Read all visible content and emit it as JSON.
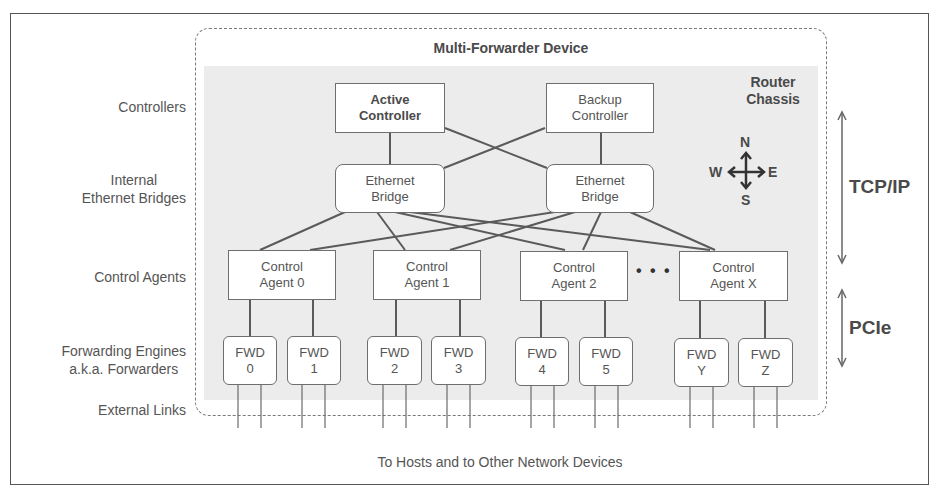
{
  "device_title": "Multi-Forwarder Device",
  "chassis_label": [
    "Router",
    "Chassis"
  ],
  "row_labels": {
    "controllers": "Controllers",
    "bridges": [
      "Internal",
      "Ethernet Bridges"
    ],
    "agents": "Control Agents",
    "forwarders": [
      "Forwarding Engines",
      "a.k.a. Forwarders"
    ],
    "links": "External Links"
  },
  "controllers": [
    {
      "line1": "Active",
      "line2": "Controller",
      "emphasis": true
    },
    {
      "line1": "Backup",
      "line2": "Controller",
      "emphasis": false
    }
  ],
  "bridges": [
    {
      "line1": "Ethernet",
      "line2": "Bridge"
    },
    {
      "line1": "Ethernet",
      "line2": "Bridge"
    }
  ],
  "agents": [
    {
      "line1": "Control",
      "line2": "Agent 0"
    },
    {
      "line1": "Control",
      "line2": "Agent 1"
    },
    {
      "line1": "Control",
      "line2": "Agent 2"
    },
    {
      "line1": "Control",
      "line2": "Agent X"
    }
  ],
  "ellipsis": "• • •",
  "forwarders": [
    {
      "line1": "FWD",
      "line2": "0"
    },
    {
      "line1": "FWD",
      "line2": "1"
    },
    {
      "line1": "FWD",
      "line2": "2"
    },
    {
      "line1": "FWD",
      "line2": "3"
    },
    {
      "line1": "FWD",
      "line2": "4"
    },
    {
      "line1": "FWD",
      "line2": "5"
    },
    {
      "line1": "FWD",
      "line2": "Y"
    },
    {
      "line1": "FWD",
      "line2": "Z"
    }
  ],
  "compass": {
    "n": "N",
    "s": "S",
    "e": "E",
    "w": "W"
  },
  "protocols": {
    "upper": "TCP/IP",
    "lower": "PCIe"
  },
  "footer": "To Hosts and to Other Network Devices"
}
